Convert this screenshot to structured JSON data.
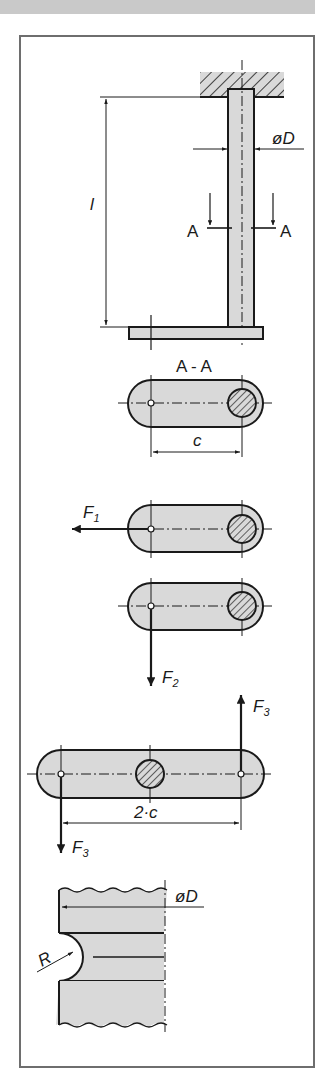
{
  "figure": {
    "colors": {
      "part_fill": "#d9d9d9",
      "line": "#1a1a1a",
      "frame": "#6e6e6e",
      "header_bar": "#c9c9c9"
    }
  },
  "side_view": {
    "diameter_label": "øD",
    "length_label": "l",
    "section_marker_left": "A",
    "section_marker_right": "A"
  },
  "section_view": {
    "title": "A - A",
    "distance_label": "c"
  },
  "load_case_1": {
    "force_label": "F",
    "force_subscript": "1"
  },
  "load_case_2": {
    "force_label": "F",
    "force_subscript": "2"
  },
  "load_case_3": {
    "force_up_label": "F",
    "force_up_subscript": "3",
    "force_down_label": "F",
    "force_down_subscript": "3",
    "distance_label": "2·c"
  },
  "groove_detail": {
    "diameter_label": "øD",
    "radius_label": "R"
  }
}
